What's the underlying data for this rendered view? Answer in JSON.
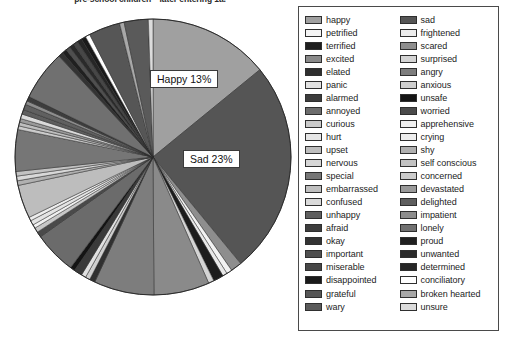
{
  "chart_data": {
    "type": "pie",
    "title": "pre-school children—later entering 1a.",
    "xlabel": "",
    "ylabel": "",
    "legend_position": "right",
    "grid": false,
    "data_labels": [
      {
        "name": "Happy",
        "text": "Happy 13%",
        "value": 13
      },
      {
        "name": "Sad",
        "text": "Sad 23%",
        "value": 23
      }
    ],
    "categories": [
      "happy",
      "sad",
      "petrified",
      "frightened",
      "terrified",
      "scared",
      "excited",
      "surprised",
      "elated",
      "angry",
      "panic",
      "anxious",
      "alarmed",
      "unsafe",
      "annoyed",
      "worried",
      "curious",
      "apprehensive",
      "hurt",
      "crying",
      "upset",
      "shy",
      "nervous",
      "self conscious",
      "special",
      "concerned",
      "embarrassed",
      "devastated",
      "confused",
      "delighted",
      "unhappy",
      "impatient",
      "afraid",
      "lonely",
      "okay",
      "proud",
      "important",
      "unwanted",
      "miserable",
      "determined",
      "disappointed",
      "conciliatory",
      "grateful",
      "broken hearted",
      "wary",
      "unsure"
    ],
    "values": [
      13,
      23,
      0.5,
      0.6,
      0.5,
      6.2,
      0.5,
      0.7,
      1.5,
      4.3,
      0.5,
      0.6,
      0.7,
      0.4,
      0.5,
      3.4,
      4.6,
      0.5,
      0.5,
      0.5,
      0.7,
      0.4,
      4.3,
      3.2,
      0.5,
      0.5,
      0.7,
      0.4,
      0.6,
      0.6,
      0.5,
      0.5,
      0.5,
      5.4,
      0.5,
      0.5,
      0.7,
      0.5,
      0.5,
      0.5,
      0.5,
      0.5,
      3.2,
      0.5,
      2.6,
      0.5
    ],
    "slices": [
      {
        "name": "happy",
        "value": 13.0,
        "color": "#a0a0a0"
      },
      {
        "name": "sad",
        "value": 23.0,
        "color": "#555555"
      },
      {
        "name": "scared",
        "value": 1.2,
        "color": "#8e8e8e"
      },
      {
        "name": "petrified",
        "value": 0.6,
        "color": "#f2f2f2"
      },
      {
        "name": "frightened",
        "value": 0.5,
        "color": "#e8e8e8"
      },
      {
        "name": "terrified",
        "value": 1.1,
        "color": "#1c1c1c"
      },
      {
        "name": "surprised",
        "value": 0.6,
        "color": "#d4d4d4"
      },
      {
        "name": "excited",
        "value": 6.0,
        "color": "#8a8a8a"
      },
      {
        "name": "angry",
        "value": 6.5,
        "color": "#7d7d7d"
      },
      {
        "name": "elated",
        "value": 0.6,
        "color": "#303030"
      },
      {
        "name": "anxious",
        "value": 0.5,
        "color": "#cfcfcf"
      },
      {
        "name": "panic",
        "value": 0.5,
        "color": "#e0e0e0"
      },
      {
        "name": "alarmed",
        "value": 0.9,
        "color": "#3a3a3a"
      },
      {
        "name": "unsafe",
        "value": 0.5,
        "color": "#141414"
      },
      {
        "name": "annoyed",
        "value": 4.6,
        "color": "#6b6b6b"
      },
      {
        "name": "worried",
        "value": 0.6,
        "color": "#4a4a4a"
      },
      {
        "name": "curious",
        "value": 0.5,
        "color": "#c8c8c8"
      },
      {
        "name": "apprehensive",
        "value": 0.4,
        "color": "#f0f0f0"
      },
      {
        "name": "hurt",
        "value": 0.5,
        "color": "#e4e4e4"
      },
      {
        "name": "crying",
        "value": 0.4,
        "color": "#ededed"
      },
      {
        "name": "upset",
        "value": 3.6,
        "color": "#bdbdbd"
      },
      {
        "name": "shy",
        "value": 0.5,
        "color": "#b0b0b0"
      },
      {
        "name": "nervous",
        "value": 0.5,
        "color": "#d8d8d8"
      },
      {
        "name": "self conscious",
        "value": 0.5,
        "color": "#c2c2c2"
      },
      {
        "name": "special",
        "value": 4.5,
        "color": "#767676"
      },
      {
        "name": "concerned",
        "value": 0.4,
        "color": "#cbcbcb"
      },
      {
        "name": "embarrassed",
        "value": 0.4,
        "color": "#bebebe"
      },
      {
        "name": "devastated",
        "value": 0.4,
        "color": "#9a9a9a"
      },
      {
        "name": "confused",
        "value": 0.5,
        "color": "#dadada"
      },
      {
        "name": "delighted",
        "value": 0.5,
        "color": "#5e5e5e"
      },
      {
        "name": "unhappy",
        "value": 0.6,
        "color": "#606060"
      },
      {
        "name": "impatient",
        "value": 0.4,
        "color": "#8d8d8d"
      },
      {
        "name": "afraid",
        "value": 0.5,
        "color": "#3d3d3d"
      },
      {
        "name": "lonely",
        "value": 5.4,
        "color": "#707070"
      },
      {
        "name": "okay",
        "value": 0.5,
        "color": "#333333"
      },
      {
        "name": "proud",
        "value": 0.5,
        "color": "#202020"
      },
      {
        "name": "important",
        "value": 0.5,
        "color": "#4f4f4f"
      },
      {
        "name": "unwanted",
        "value": 0.5,
        "color": "#2a2a2a"
      },
      {
        "name": "miserable",
        "value": 0.5,
        "color": "#474747"
      },
      {
        "name": "determined",
        "value": 0.5,
        "color": "#262626"
      },
      {
        "name": "disappointed",
        "value": 0.5,
        "color": "#1a1a1a"
      },
      {
        "name": "conciliatory",
        "value": 0.5,
        "color": "#ffffff"
      },
      {
        "name": "grateful",
        "value": 3.4,
        "color": "#565656"
      },
      {
        "name": "broken hearted",
        "value": 0.5,
        "color": "#a8a8a8"
      },
      {
        "name": "wary",
        "value": 2.6,
        "color": "#5a5a5a"
      },
      {
        "name": "unsure",
        "value": 0.5,
        "color": "#dcdcdc"
      }
    ]
  },
  "legend": {
    "left_column": [
      {
        "label": "happy",
        "color": "#a0a0a0"
      },
      {
        "label": "petrified",
        "color": "#f4f4f4"
      },
      {
        "label": "terrified",
        "color": "#1e1e1e"
      },
      {
        "label": "excited",
        "color": "#8a8a8a"
      },
      {
        "label": "elated",
        "color": "#2e2e2e"
      },
      {
        "label": "panic",
        "color": "#e2e2e2"
      },
      {
        "label": "alarmed",
        "color": "#3c3c3c"
      },
      {
        "label": "annoyed",
        "color": "#6c6c6c"
      },
      {
        "label": "curious",
        "color": "#cacaca"
      },
      {
        "label": "hurt",
        "color": "#e6e6e6"
      },
      {
        "label": "upset",
        "color": "#bdbdbd"
      },
      {
        "label": "nervous",
        "color": "#d6d6d6"
      },
      {
        "label": "special",
        "color": "#767676"
      },
      {
        "label": "embarrassed",
        "color": "#bfbfbf"
      },
      {
        "label": "confused",
        "color": "#dadada"
      },
      {
        "label": "unhappy",
        "color": "#5f5f5f"
      },
      {
        "label": "afraid",
        "color": "#3d3d3d"
      },
      {
        "label": "okay",
        "color": "#333333"
      },
      {
        "label": "important",
        "color": "#4f4f4f"
      },
      {
        "label": "miserable",
        "color": "#474747"
      },
      {
        "label": "disappointed",
        "color": "#1a1a1a"
      },
      {
        "label": "grateful",
        "color": "#565656"
      },
      {
        "label": "wary",
        "color": "#5a5a5a"
      }
    ],
    "right_column": [
      {
        "label": "sad",
        "color": "#555555"
      },
      {
        "label": "frightened",
        "color": "#ececec"
      },
      {
        "label": "scared",
        "color": "#8e8e8e"
      },
      {
        "label": "surprised",
        "color": "#d4d4d4"
      },
      {
        "label": "angry",
        "color": "#7d7d7d"
      },
      {
        "label": "anxious",
        "color": "#cfcfcf"
      },
      {
        "label": "unsafe",
        "color": "#141414"
      },
      {
        "label": "worried",
        "color": "#4a4a4a"
      },
      {
        "label": "apprehensive",
        "color": "#f0f0f0"
      },
      {
        "label": "crying",
        "color": "#ededed"
      },
      {
        "label": "shy",
        "color": "#b0b0b0"
      },
      {
        "label": "self conscious",
        "color": "#c2c2c2"
      },
      {
        "label": "concerned",
        "color": "#cbcbcb"
      },
      {
        "label": "devastated",
        "color": "#9a9a9a"
      },
      {
        "label": "delighted",
        "color": "#5e5e5e"
      },
      {
        "label": "impatient",
        "color": "#8d8d8d"
      },
      {
        "label": "lonely",
        "color": "#707070"
      },
      {
        "label": "proud",
        "color": "#202020"
      },
      {
        "label": "unwanted",
        "color": "#2a2a2a"
      },
      {
        "label": "determined",
        "color": "#262626"
      },
      {
        "label": "conciliatory",
        "color": "#ffffff"
      },
      {
        "label": "broken hearted",
        "color": "#a8a8a8"
      },
      {
        "label": "unsure",
        "color": "#dcdcdc"
      }
    ]
  }
}
